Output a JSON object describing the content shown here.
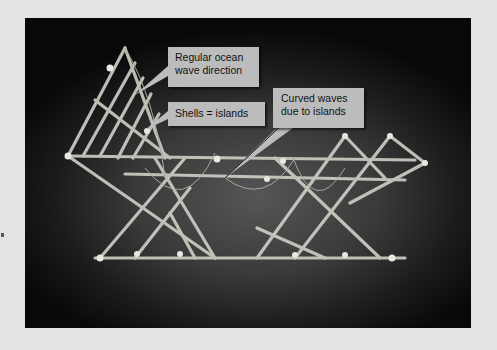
{
  "figure": {
    "colors": {
      "page_background": "#e3e3e3",
      "photo_background": "#1c1c1c",
      "callout_fill": "#bcbcbc",
      "callout_text": "#111111",
      "stick": "#cfcfc6"
    },
    "callouts": [
      {
        "id": "regular-waves",
        "lines": [
          "Regular ocean",
          "wave direction"
        ]
      },
      {
        "id": "shells",
        "lines": [
          "Shells = islands"
        ]
      },
      {
        "id": "curved-waves",
        "lines": [
          "Curved waves",
          "due to islands"
        ]
      }
    ]
  }
}
